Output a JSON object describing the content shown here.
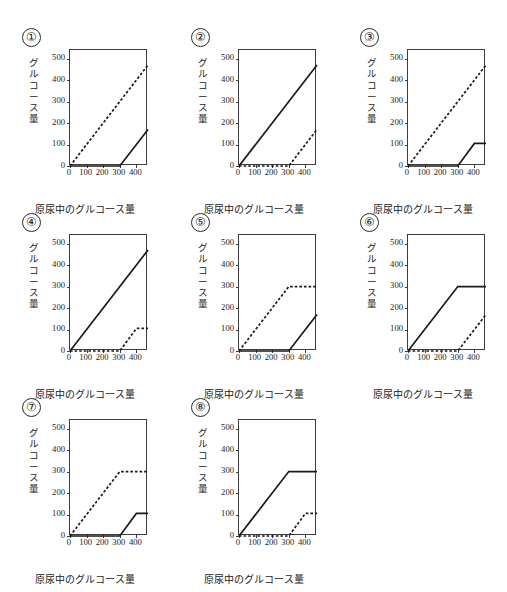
{
  "figure": {
    "panel_count": 8,
    "axis": {
      "xlabel": "原尿中のグルコース量",
      "ylabel_chars": [
        "グ",
        "ル",
        "コ",
        "ー",
        "ス",
        "量"
      ],
      "ylabel": "グルコース量",
      "xticks": [
        0,
        100,
        200,
        300,
        400
      ],
      "yticks": [
        0,
        100,
        200,
        300,
        400,
        500
      ],
      "xlim": [
        0,
        470
      ],
      "ylim": [
        0,
        540
      ],
      "grid": false,
      "legend": "none"
    },
    "line_color": "#1a1a1a",
    "frame_color": "#3d3d3d"
  },
  "panels": [
    {
      "id": "panel-1",
      "number": "①",
      "chart_data": {
        "type": "line",
        "title": "①",
        "xlabel": "原尿中のグルコース量",
        "ylabel": "グルコース量",
        "xlim": [
          0,
          470
        ],
        "ylim": [
          0,
          540
        ],
        "xticks": [
          0,
          100,
          200,
          300,
          400
        ],
        "yticks": [
          0,
          100,
          200,
          300,
          400,
          500
        ],
        "grid": false,
        "series": [
          {
            "name": "dashed",
            "style": "dashed",
            "x": [
              0,
              470
            ],
            "y": [
              0,
              470
            ]
          },
          {
            "name": "solid",
            "style": "solid",
            "x": [
              0,
              300,
              470
            ],
            "y": [
              0,
              0,
              170
            ]
          }
        ]
      }
    },
    {
      "id": "panel-2",
      "number": "②",
      "chart_data": {
        "type": "line",
        "title": "②",
        "xlabel": "原尿中のグルコース量",
        "ylabel": "グルコース量",
        "xlim": [
          0,
          470
        ],
        "ylim": [
          0,
          540
        ],
        "xticks": [
          0,
          100,
          200,
          300,
          400
        ],
        "yticks": [
          0,
          100,
          200,
          300,
          400,
          500
        ],
        "grid": false,
        "series": [
          {
            "name": "solid",
            "style": "solid",
            "x": [
              0,
              470
            ],
            "y": [
              0,
              470
            ]
          },
          {
            "name": "dashed",
            "style": "dashed",
            "x": [
              0,
              300,
              470
            ],
            "y": [
              0,
              0,
              170
            ]
          }
        ]
      }
    },
    {
      "id": "panel-3",
      "number": "③",
      "chart_data": {
        "type": "line",
        "title": "③",
        "xlabel": "原尿中のグルコース量",
        "ylabel": "グルコース量",
        "xlim": [
          0,
          470
        ],
        "ylim": [
          0,
          540
        ],
        "xticks": [
          0,
          100,
          200,
          300,
          400
        ],
        "yticks": [
          0,
          100,
          200,
          300,
          400,
          500
        ],
        "grid": false,
        "series": [
          {
            "name": "dashed",
            "style": "dashed",
            "x": [
              0,
              470
            ],
            "y": [
              0,
              470
            ]
          },
          {
            "name": "solid",
            "style": "solid",
            "x": [
              0,
              300,
              400,
              470
            ],
            "y": [
              0,
              0,
              105,
              105
            ]
          }
        ]
      }
    },
    {
      "id": "panel-4",
      "number": "④",
      "chart_data": {
        "type": "line",
        "title": "④",
        "xlabel": "原尿中のグルコース量",
        "ylabel": "グルコース量",
        "xlim": [
          0,
          470
        ],
        "ylim": [
          0,
          540
        ],
        "xticks": [
          0,
          100,
          200,
          300,
          400
        ],
        "yticks": [
          0,
          100,
          200,
          300,
          400,
          500
        ],
        "grid": false,
        "series": [
          {
            "name": "solid",
            "style": "solid",
            "x": [
              0,
              470
            ],
            "y": [
              0,
              470
            ]
          },
          {
            "name": "dashed",
            "style": "dashed",
            "x": [
              0,
              300,
              400,
              470
            ],
            "y": [
              0,
              0,
              105,
              105
            ]
          }
        ]
      }
    },
    {
      "id": "panel-5",
      "number": "⑤",
      "chart_data": {
        "type": "line",
        "title": "⑤",
        "xlabel": "原尿中のグルコース量",
        "ylabel": "グルコース量",
        "xlim": [
          0,
          470
        ],
        "ylim": [
          0,
          540
        ],
        "xticks": [
          0,
          100,
          200,
          300,
          400
        ],
        "yticks": [
          0,
          100,
          200,
          300,
          400,
          500
        ],
        "grid": false,
        "series": [
          {
            "name": "dashed",
            "style": "dashed",
            "x": [
              0,
              300,
              470
            ],
            "y": [
              0,
              300,
              300
            ]
          },
          {
            "name": "solid",
            "style": "solid",
            "x": [
              0,
              300,
              470
            ],
            "y": [
              0,
              0,
              170
            ]
          }
        ]
      }
    },
    {
      "id": "panel-6",
      "number": "⑥",
      "chart_data": {
        "type": "line",
        "title": "⑥",
        "xlabel": "原尿中のグルコース量",
        "ylabel": "グルコース量",
        "xlim": [
          0,
          470
        ],
        "ylim": [
          0,
          540
        ],
        "xticks": [
          0,
          100,
          200,
          300,
          400
        ],
        "yticks": [
          0,
          100,
          200,
          300,
          400,
          500
        ],
        "grid": false,
        "series": [
          {
            "name": "solid",
            "style": "solid",
            "x": [
              0,
              300,
              470
            ],
            "y": [
              0,
              300,
              300
            ]
          },
          {
            "name": "dashed",
            "style": "dashed",
            "x": [
              0,
              300,
              470
            ],
            "y": [
              0,
              0,
              170
            ]
          }
        ]
      }
    },
    {
      "id": "panel-7",
      "number": "⑦",
      "chart_data": {
        "type": "line",
        "title": "⑦",
        "xlabel": "原尿中のグルコース量",
        "ylabel": "グルコース量",
        "xlim": [
          0,
          470
        ],
        "ylim": [
          0,
          540
        ],
        "xticks": [
          0,
          100,
          200,
          300,
          400
        ],
        "yticks": [
          0,
          100,
          200,
          300,
          400,
          500
        ],
        "grid": false,
        "series": [
          {
            "name": "dashed",
            "style": "dashed",
            "x": [
              0,
              300,
              470
            ],
            "y": [
              0,
              300,
              300
            ]
          },
          {
            "name": "solid",
            "style": "solid",
            "x": [
              0,
              300,
              400,
              470
            ],
            "y": [
              0,
              0,
              105,
              105
            ]
          }
        ]
      }
    },
    {
      "id": "panel-8",
      "number": "⑧",
      "chart_data": {
        "type": "line",
        "title": "⑧",
        "xlabel": "原尿中のグルコース量",
        "ylabel": "グルコース量",
        "xlim": [
          0,
          470
        ],
        "ylim": [
          0,
          540
        ],
        "xticks": [
          0,
          100,
          200,
          300,
          400
        ],
        "yticks": [
          0,
          100,
          200,
          300,
          400,
          500
        ],
        "grid": false,
        "series": [
          {
            "name": "solid",
            "style": "solid",
            "x": [
              0,
              300,
              470
            ],
            "y": [
              0,
              300,
              300
            ]
          },
          {
            "name": "dashed",
            "style": "dashed",
            "x": [
              0,
              300,
              400,
              470
            ],
            "y": [
              0,
              0,
              105,
              105
            ]
          }
        ]
      }
    }
  ]
}
